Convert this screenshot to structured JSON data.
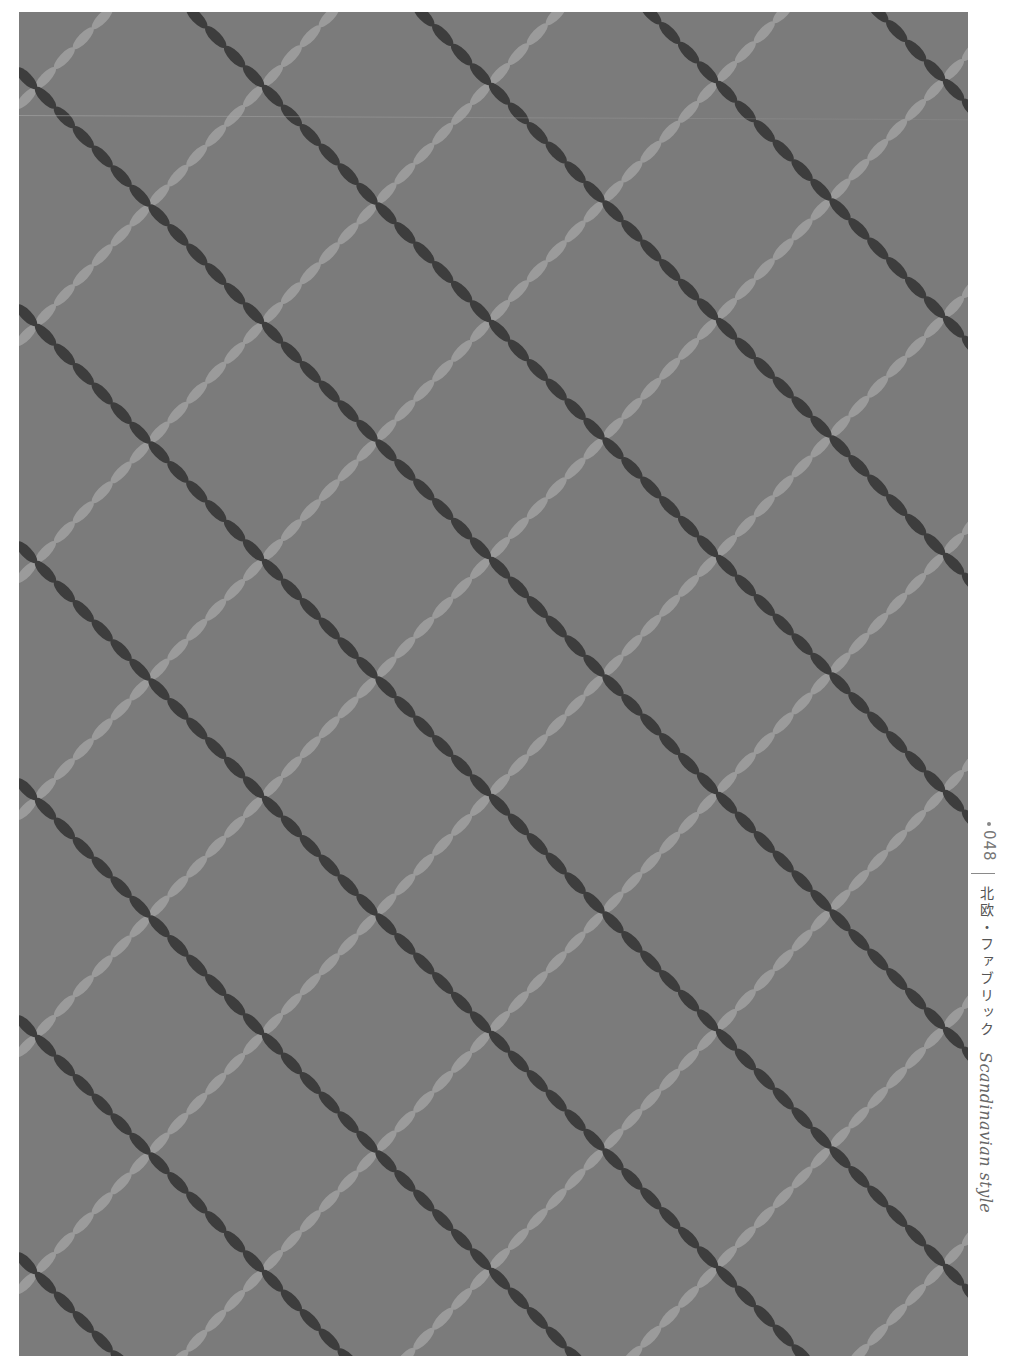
{
  "page": {
    "background": "#ffffff"
  },
  "fabric": {
    "title": "Scandinavian fabric diamond lattice",
    "background_color": "#7b7b7b",
    "dark_line_color": "#3d3d3d",
    "light_line_color": "#9b9b9b",
    "lattice": {
      "origin": [
        17,
        76
      ],
      "u": [
        113.5,
        117.5
      ],
      "v": [
        113.5,
        -119.5
      ],
      "segments_per_edge": 6,
      "dark_thickness": 11,
      "light_thickness": 10
    }
  },
  "sidebar": {
    "page_number": "048",
    "caption_jp": "北欧・ファブリック",
    "caption_en": "Scandinavian style",
    "text_color": "#666666"
  }
}
